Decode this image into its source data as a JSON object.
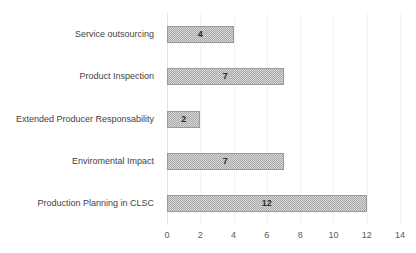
{
  "chart_data": {
    "type": "bar",
    "orientation": "horizontal",
    "title": "",
    "xlabel": "",
    "ylabel": "",
    "categories": [
      "Service outsourcing",
      "Product Inspection",
      "Extended Producer Responsability",
      "Enviromental Impact",
      "Production Planning  in CLSC"
    ],
    "values": [
      4,
      7,
      2,
      7,
      12
    ],
    "data_labels": [
      "4",
      "7",
      "2",
      "7",
      "12"
    ],
    "xlim": [
      0,
      14
    ],
    "xticks": [
      0,
      2,
      4,
      6,
      8,
      10,
      12,
      14
    ],
    "xtick_labels": [
      "0",
      "2",
      "4",
      "6",
      "8",
      "10",
      "12",
      "14"
    ],
    "grid": "vertical",
    "legend": "none",
    "colors": {
      "bar_fill": "#a8a8a8",
      "bar_border": "#9a9a9a",
      "gridline": "#f3f3f3",
      "axis_line": "#e4e4e4",
      "label_text": "#434343",
      "tick_text": "#5a5a5a",
      "value_text": "#2b2b2b",
      "background": "#ffffff"
    }
  }
}
